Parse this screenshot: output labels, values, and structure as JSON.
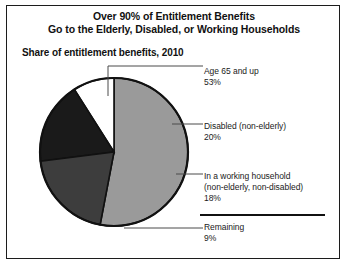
{
  "figure": {
    "title_line1": "Over 90% of Entitlement Benefits",
    "title_line2": "Go to the Elderly, Disabled, or Working Households",
    "subtitle": "Share of entitlement benefits, 2010"
  },
  "chart_data": {
    "type": "pie",
    "title": "Over 90% of Entitlement Benefits Go to the Elderly, Disabled, or Working Households",
    "subtitle": "Share of entitlement benefits, 2010",
    "xlabel": "",
    "ylabel": "",
    "grid": false,
    "legend_position": "callout-labels-right",
    "start_angle_deg": 0,
    "direction": "clockwise",
    "categories": [
      "Age 65 and up",
      "Disabled (non-elderly)",
      "In a working household (non-elderly, non-disabled)",
      "Remaining"
    ],
    "values": [
      53,
      20,
      18,
      9
    ],
    "value_labels": [
      "53%",
      "20%",
      "18%",
      "9%"
    ],
    "colors": [
      "#9a9a9a",
      "#3d3d3d",
      "#1a1a1a",
      "#ffffff"
    ],
    "slices": [
      {
        "name": "Age 65 and up",
        "label_line1": "Age 65 and up",
        "label_line2": "53%",
        "value": 53,
        "color": "#9a9a9a"
      },
      {
        "name": "Disabled (non-elderly)",
        "label_line1": "Disabled (non-elderly)",
        "label_line2": "20%",
        "value": 20,
        "color": "#3d3d3d"
      },
      {
        "name": "In a working household",
        "label_line1": "In a working household",
        "label_line2": "(non-elderly, non-disabled)",
        "label_line3": "18%",
        "value": 18,
        "color": "#1a1a1a"
      },
      {
        "name": "Remaining",
        "label_line1": "Remaining",
        "label_line2": "9%",
        "value": 9,
        "color": "#ffffff"
      }
    ]
  }
}
